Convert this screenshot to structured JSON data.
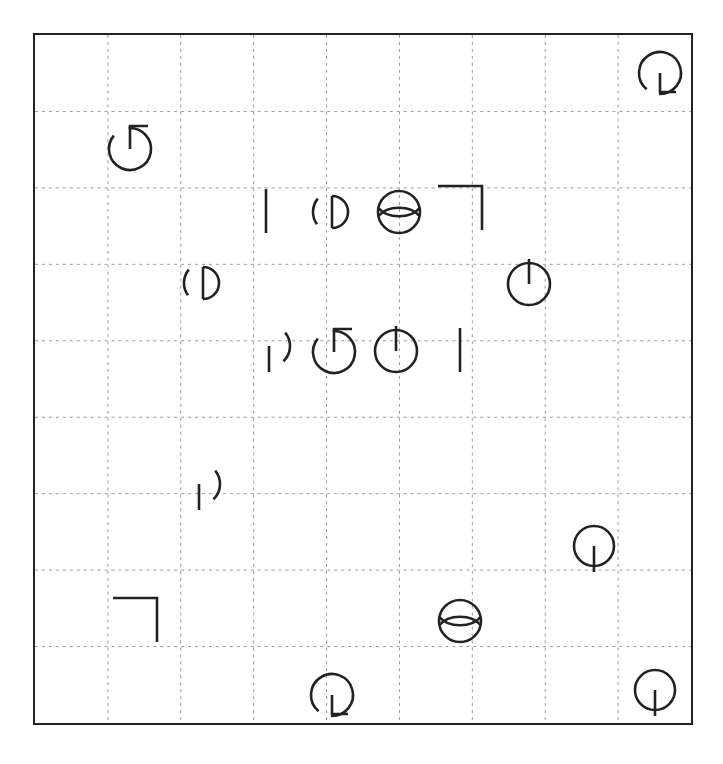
{
  "canvas": {
    "width": 723,
    "height": 764,
    "background": "#ffffff",
    "stroke_color": "#222222"
  },
  "frame": {
    "name": "bounding-box",
    "x": 33,
    "y": 33,
    "width": 660,
    "height": 692,
    "border_width": 2,
    "border_color": "#222222"
  },
  "grid": {
    "columns": 9,
    "rows": 9,
    "line_style": "dotted",
    "line_color": "#9a9a9a",
    "line_width": 1,
    "cell_width": 73.3,
    "cell_height": 76.9
  },
  "legend": {
    "circle-l-tail": "circle open at lower-left with L shaped tail",
    "circle-up-stem-tail": "circle open at upper-left with vertical stem and right tail",
    "vertical-bar": "plain vertical line segment",
    "circle-inner-d": "circle open at left containing a D shape",
    "circle-lens": "circle overlaid with a horizontal lens",
    "circle-up-stem": "closed circle with vertical stem rising from center",
    "circle-gap-right-down-stem": "circle open at right with vertical stem descending",
    "circle-down-stem": "closed circle with vertical stem descending from center",
    "corner-bracket": "right angle corner bracket"
  },
  "shapes": [
    {
      "id": 1,
      "name": "circle-l-tail",
      "x": 660,
      "y": 75,
      "scale": 1.0
    },
    {
      "id": 2,
      "name": "circle-up-stem-tail",
      "x": 130,
      "y": 147,
      "scale": 1.0
    },
    {
      "id": 3,
      "name": "vertical-bar",
      "x": 266,
      "y": 211,
      "scale": 1.0
    },
    {
      "id": 4,
      "name": "circle-inner-d",
      "x": 334,
      "y": 212,
      "scale": 1.0
    },
    {
      "id": 5,
      "name": "circle-lens",
      "x": 399,
      "y": 212,
      "scale": 1.0
    },
    {
      "id": 6,
      "name": "corner-bracket",
      "x": 462,
      "y": 208,
      "scale": 1.0
    },
    {
      "id": 7,
      "name": "circle-inner-d",
      "x": 205,
      "y": 283,
      "scale": 1.0
    },
    {
      "id": 8,
      "name": "circle-up-stem",
      "x": 529,
      "y": 282,
      "scale": 1.0
    },
    {
      "id": 9,
      "name": "circle-gap-right-down-stem",
      "x": 269,
      "y": 348,
      "scale": 1.0
    },
    {
      "id": 10,
      "name": "circle-up-stem-tail",
      "x": 334,
      "y": 350,
      "scale": 1.0
    },
    {
      "id": 11,
      "name": "circle-up-stem",
      "x": 396,
      "y": 349,
      "scale": 1.0
    },
    {
      "id": 12,
      "name": "vertical-bar",
      "x": 460,
      "y": 350,
      "scale": 1.0
    },
    {
      "id": 13,
      "name": "circle-gap-right-down-stem",
      "x": 199,
      "y": 486,
      "scale": 1.0
    },
    {
      "id": 14,
      "name": "circle-down-stem",
      "x": 594,
      "y": 550,
      "scale": 1.0
    },
    {
      "id": 15,
      "name": "corner-bracket",
      "x": 137,
      "y": 620,
      "scale": 1.0
    },
    {
      "id": 16,
      "name": "circle-lens",
      "x": 460,
      "y": 621,
      "scale": 1.0
    },
    {
      "id": 17,
      "name": "circle-l-tail",
      "x": 332,
      "y": 697,
      "scale": 1.0
    },
    {
      "id": 18,
      "name": "circle-down-stem",
      "x": 655,
      "y": 694,
      "scale": 1.0
    }
  ]
}
